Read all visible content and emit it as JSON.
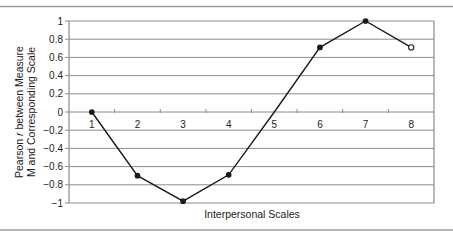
{
  "chart_data": {
    "type": "line",
    "title": "",
    "xlabel": "Interpersonal Scales",
    "ylabel_lines": [
      "Pearson r between Measure",
      "M and Corresponding Scale"
    ],
    "ylabel_italic_word": "r",
    "categories": [
      "1",
      "2",
      "3",
      "4",
      "5",
      "6",
      "7",
      "8"
    ],
    "series": [
      {
        "name": "Pearson r",
        "values": [
          0,
          -0.7,
          -0.98,
          -0.69,
          0.0,
          0.71,
          1.0,
          0.71
        ],
        "markers": [
          "filled",
          "filled",
          "filled",
          "filled",
          "none",
          "filled",
          "filled",
          "open"
        ]
      }
    ],
    "ylim": [
      -1,
      1
    ],
    "yticks": [
      1,
      0.8,
      0.6,
      0.4,
      0.2,
      0,
      -0.2,
      -0.4,
      -0.6,
      -0.8,
      -1
    ],
    "ytick_labels": [
      "1",
      "0.8",
      "0.6",
      "0.4",
      "0.2",
      "0",
      "−0.2",
      "−0.4",
      "−0.6",
      "−0.8",
      "−1"
    ],
    "grid": true,
    "xtick_labels_position": "below zero line",
    "colors": {
      "line": "#1a1a1a",
      "grid": "#8c8c8c",
      "text": "#222222",
      "rule": "#9a9a9a"
    }
  }
}
